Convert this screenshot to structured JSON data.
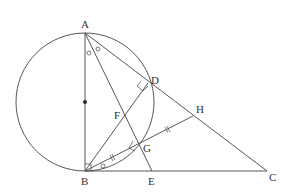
{
  "diagram": {
    "type": "geometry",
    "points": {
      "A": {
        "label": "A",
        "x": 85,
        "y": 33
      },
      "B": {
        "label": "B",
        "x": 85,
        "y": 171
      },
      "C": {
        "label": "C",
        "x": 267,
        "y": 171
      },
      "D": {
        "label": "D",
        "x": 148,
        "y": 83
      },
      "E": {
        "label": "E",
        "x": 152,
        "y": 171
      },
      "F": {
        "label": "F",
        "x": 124,
        "y": 114
      },
      "G": {
        "label": "G",
        "x": 138,
        "y": 146
      },
      "H": {
        "label": "H",
        "x": 193,
        "y": 116
      }
    },
    "circle": {
      "cx": 85,
      "cy": 102,
      "r": 69,
      "diameter": "AB",
      "center_marked": true
    },
    "segments": [
      "AB",
      "AC",
      "BC",
      "AE",
      "BD",
      "BH",
      "AD",
      "DC"
    ],
    "markers": {
      "equal_angles_at_A": [
        "BAE",
        "EAD"
      ],
      "right_angles": [
        "ADB",
        "BGE",
        "ABC"
      ],
      "equal_segments": [
        "BG",
        "GH"
      ]
    }
  }
}
